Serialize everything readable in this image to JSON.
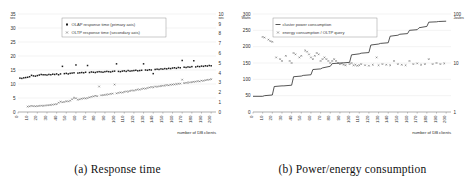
{
  "figure": {
    "panels": [
      {
        "caption": "(a) Response time",
        "legend": [
          {
            "marker": "square",
            "label": "OLAP response time (primary axis)"
          },
          {
            "marker": "cross",
            "label": "OLTP response time (secondary axis)"
          }
        ],
        "axes": {
          "left_unit": "sec",
          "right_unit": "sec",
          "xlabel": "number of DB clients",
          "left_ticks": [
            "0",
            "5",
            "10",
            "15",
            "20",
            "25",
            "30",
            "35"
          ],
          "right_ticks": [
            "0",
            "1",
            "2",
            "3",
            "4",
            "5",
            "6",
            "7",
            "8",
            "9",
            "10"
          ],
          "x_ticks": [
            "0",
            "10",
            "20",
            "30",
            "40",
            "50",
            "60",
            "70",
            "80",
            "90",
            "100",
            "110",
            "120",
            "130",
            "140",
            "150",
            "160",
            "170",
            "180",
            "190",
            "200"
          ]
        }
      },
      {
        "caption": "(b) Power/energy consumption",
        "legend": [
          {
            "marker": "line",
            "label": "cluster power consumption"
          },
          {
            "marker": "cross",
            "label": "energy consumption / OLTP query"
          }
        ],
        "axes": {
          "left_unit": "Watts",
          "right_unit": "Joules",
          "xlabel": "number of DB clients",
          "left_ticks": [
            "0",
            "50",
            "100",
            "150",
            "200",
            "250",
            "300"
          ],
          "right_ticks": [
            "1",
            "10",
            "100"
          ],
          "x_ticks": [
            "0",
            "10",
            "20",
            "30",
            "40",
            "50",
            "60",
            "70",
            "80",
            "90",
            "100",
            "110",
            "120",
            "130",
            "140",
            "150",
            "160",
            "170",
            "180",
            "190",
            "200"
          ]
        }
      }
    ]
  },
  "chart_data": [
    {
      "type": "scatter",
      "title": "(a) Response time",
      "xlabel": "number of DB clients",
      "ylabel": "sec",
      "y2label": "sec",
      "xlim": [
        0,
        205
      ],
      "ylim": [
        0,
        35
      ],
      "y2lim": [
        0,
        10
      ],
      "grid": true,
      "legend_position": "upper-center",
      "series": [
        {
          "name": "OLAP response time (primary axis)",
          "axis": "primary",
          "marker": "square",
          "x": [
            2,
            4,
            6,
            8,
            10,
            12,
            14,
            16,
            18,
            20,
            22,
            24,
            26,
            28,
            30,
            32,
            34,
            36,
            38,
            40,
            42,
            44,
            46,
            48,
            50,
            52,
            54,
            56,
            58,
            60,
            62,
            64,
            66,
            68,
            70,
            72,
            74,
            76,
            78,
            80,
            82,
            84,
            86,
            88,
            90,
            92,
            94,
            96,
            98,
            100,
            102,
            104,
            106,
            108,
            110,
            112,
            114,
            116,
            118,
            120,
            122,
            124,
            126,
            128,
            130,
            132,
            134,
            136,
            138,
            140,
            142,
            144,
            146,
            148,
            150,
            152,
            154,
            156,
            158,
            160,
            162,
            164,
            166,
            168,
            170,
            172,
            174,
            176,
            178,
            180,
            182,
            184,
            186,
            188,
            190,
            192,
            194,
            196,
            198,
            200
          ],
          "y": [
            12.1,
            12.0,
            12.2,
            12.3,
            12.4,
            12.6,
            13.1,
            12.9,
            12.8,
            13.0,
            13.2,
            13.4,
            13.3,
            13.3,
            13.2,
            13.4,
            13.3,
            13.5,
            13.4,
            13.6,
            13.3,
            13.6,
            16.3,
            13.7,
            13.8,
            13.6,
            13.8,
            13.9,
            14.0,
            16.8,
            13.9,
            14.0,
            14.1,
            14.0,
            14.2,
            16.6,
            14.1,
            14.3,
            14.2,
            14.1,
            14.3,
            14.4,
            14.3,
            14.2,
            14.4,
            14.5,
            14.4,
            14.3,
            14.5,
            14.6,
            17.2,
            14.5,
            14.4,
            14.6,
            14.7,
            14.5,
            14.8,
            14.6,
            14.7,
            14.8,
            14.9,
            14.7,
            14.8,
            14.9,
            17.2,
            15.0,
            14.9,
            15.1,
            15.0,
            13.7,
            15.2,
            15.3,
            15.2,
            15.4,
            15.3,
            15.5,
            15.4,
            15.6,
            15.5,
            15.7,
            15.8,
            15.6,
            15.9,
            15.8,
            18.4,
            16.0,
            15.9,
            16.1,
            16.0,
            16.2,
            18.3,
            16.1,
            16.3,
            16.2,
            16.4,
            16.3,
            16.5,
            16.4,
            16.6,
            16.5
          ]
        },
        {
          "name": "OLTP response time (secondary axis)",
          "axis": "secondary",
          "marker": "cross",
          "x": [
            10,
            12,
            14,
            16,
            18,
            20,
            22,
            24,
            26,
            28,
            30,
            32,
            34,
            36,
            38,
            40,
            42,
            44,
            46,
            48,
            50,
            52,
            54,
            56,
            58,
            60,
            62,
            64,
            66,
            68,
            70,
            72,
            74,
            76,
            78,
            80,
            82,
            84,
            86,
            88,
            90,
            92,
            94,
            96,
            98,
            100,
            102,
            104,
            106,
            108,
            110,
            112,
            114,
            116,
            118,
            120,
            122,
            124,
            126,
            128,
            130,
            132,
            134,
            136,
            138,
            140,
            142,
            144,
            146,
            148,
            150,
            152,
            154,
            156,
            158,
            160,
            162,
            164,
            166,
            168,
            170,
            172,
            174,
            176,
            178,
            180,
            182,
            184,
            186,
            188,
            190,
            192,
            194,
            196,
            198,
            200
          ],
          "y": [
            0.55,
            0.58,
            0.62,
            0.6,
            0.58,
            0.6,
            0.62,
            0.65,
            0.63,
            0.66,
            0.68,
            0.7,
            0.72,
            0.75,
            0.78,
            0.8,
            0.95,
            1.05,
            1.0,
            1.02,
            1.1,
            1.08,
            1.15,
            1.3,
            1.45,
            1.4,
            1.25,
            1.3,
            1.35,
            1.4,
            1.38,
            1.42,
            1.5,
            1.55,
            1.6,
            1.65,
            1.62,
            2.6,
            1.7,
            1.72,
            1.75,
            1.78,
            1.8,
            1.85,
            1.88,
            2.8,
            1.9,
            1.95,
            2.0,
            1.98,
            2.05,
            2.1,
            2.08,
            2.15,
            2.2,
            2.18,
            2.25,
            2.3,
            2.28,
            2.35,
            2.4,
            2.38,
            2.45,
            2.5,
            2.55,
            2.52,
            2.6,
            2.58,
            2.62,
            2.65,
            2.68,
            2.7,
            2.75,
            2.72,
            2.78,
            2.8,
            2.82,
            2.85,
            2.88,
            2.9,
            3.3,
            2.95,
            2.98,
            3.0,
            3.02,
            3.05,
            3.08,
            3.1,
            3.15,
            3.12,
            3.2,
            3.18,
            3.25,
            3.28,
            3.3,
            3.35
          ]
        }
      ]
    },
    {
      "type": "line",
      "title": "(b) Power/energy consumption",
      "xlabel": "number of DB clients",
      "ylabel": "Watts",
      "y2label": "Joules",
      "xlim": [
        0,
        205
      ],
      "ylim": [
        0,
        300
      ],
      "y2lim": [
        1,
        100
      ],
      "y2scale": "log",
      "grid": true,
      "legend_position": "upper-center",
      "series": [
        {
          "name": "cluster power consumption",
          "axis": "primary",
          "marker": "line",
          "x": [
            0,
            10,
            12,
            20,
            22,
            30,
            32,
            40,
            42,
            50,
            52,
            60,
            62,
            70,
            72,
            80,
            82,
            90,
            92,
            100,
            102,
            110,
            112,
            120,
            122,
            130,
            132,
            140,
            142,
            150,
            152,
            160,
            162,
            170,
            172,
            180,
            182,
            190,
            192,
            200
          ],
          "y": [
            48,
            48,
            50,
            52,
            78,
            80,
            80,
            82,
            108,
            110,
            112,
            114,
            130,
            132,
            135,
            140,
            148,
            150,
            150,
            152,
            175,
            178,
            180,
            182,
            205,
            208,
            210,
            212,
            232,
            235,
            238,
            240,
            250,
            252,
            258,
            262,
            275,
            276,
            277,
            278
          ]
        },
        {
          "name": "energy consumption / OLTP query",
          "axis": "secondary",
          "marker": "cross",
          "x": [
            10,
            12,
            16,
            18,
            20,
            24,
            28,
            30,
            34,
            38,
            40,
            42,
            44,
            48,
            50,
            54,
            56,
            58,
            60,
            62,
            64,
            66,
            68,
            70,
            72,
            74,
            76,
            78,
            80,
            82,
            84,
            86,
            88,
            90,
            92,
            94,
            96,
            100,
            102,
            104,
            106,
            108,
            110,
            112,
            116,
            120,
            124,
            128,
            130,
            134,
            138,
            142,
            146,
            150,
            154,
            158,
            162,
            166,
            170,
            174,
            178,
            182,
            186,
            190,
            194,
            198
          ],
          "y": [
            34,
            33,
            30,
            28,
            27,
            13,
            12,
            11,
            14,
            11,
            10,
            16,
            15,
            13,
            14,
            18,
            17,
            15,
            13,
            12,
            14,
            16,
            15,
            11,
            12,
            13,
            12,
            11,
            10,
            11,
            12,
            11,
            10,
            9.5,
            9.8,
            9.2,
            9.0,
            9.5,
            10,
            9.0,
            9.2,
            8.8,
            9.0,
            9.5,
            9.0,
            8.8,
            9.2,
            13,
            9.0,
            9.5,
            9.2,
            9.0,
            11,
            9.5,
            9.2,
            9.0,
            11,
            9.5,
            9.8,
            9.2,
            9.5,
            12,
            9.5,
            10,
            9.5,
            9.8
          ]
        }
      ]
    }
  ]
}
